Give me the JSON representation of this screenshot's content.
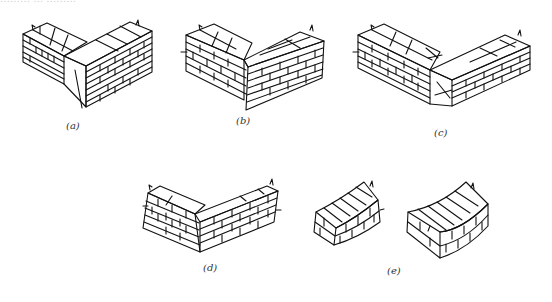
{
  "figure": {
    "top_caption_fragment": "……… … ………",
    "panels": [
      {
        "id": "a",
        "label": "(a)",
        "description": "corner brick wall, one-and-a-half brick thick, English-style bond"
      },
      {
        "id": "b",
        "label": "(b)",
        "description": "corner brick wall, alternative bond"
      },
      {
        "id": "c",
        "label": "(c)",
        "description": "corner brick wall with closer bricks at corner"
      },
      {
        "id": "d",
        "label": "(d)",
        "description": "corner brick wall, single thickness"
      },
      {
        "id": "e",
        "label": "(e)",
        "description": "two curved brick wall segments"
      }
    ]
  }
}
